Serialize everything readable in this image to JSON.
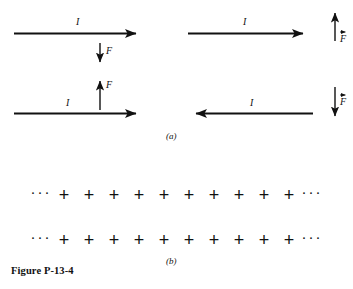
{
  "figure": {
    "caption": "Figure P-13-4",
    "panel_a_label": "(a)",
    "panel_b_label": "(b)"
  },
  "panel_a": {
    "quadrants": [
      {
        "id": "top-left",
        "current_label": "I",
        "current_direction": "right",
        "force_label": "F",
        "force_direction": "down",
        "force_position": "below-wire",
        "force_vector_notation": false
      },
      {
        "id": "top-right",
        "current_label": "I",
        "current_direction": "right",
        "force_label": "F",
        "force_direction": "up",
        "force_position": "right-of-wire",
        "force_vector_notation": true
      },
      {
        "id": "bottom-left",
        "current_label": "I",
        "current_direction": "right",
        "force_label": "F",
        "force_direction": "up",
        "force_position": "above-wire",
        "force_vector_notation": false
      },
      {
        "id": "bottom-right",
        "current_label": "I",
        "current_direction": "left",
        "force_label": "F",
        "force_direction": "down",
        "force_position": "right-of-wire",
        "force_vector_notation": true
      }
    ]
  },
  "panel_b": {
    "ellipsis_left": "···",
    "ellipsis_right": "···",
    "plus_symbol": "+",
    "rows": [
      {
        "id": "top-charge-row",
        "plus_count": 10
      },
      {
        "id": "bottom-charge-row",
        "plus_count": 10
      }
    ]
  },
  "colors": {
    "ink": "#111111",
    "background": "#ffffff"
  }
}
